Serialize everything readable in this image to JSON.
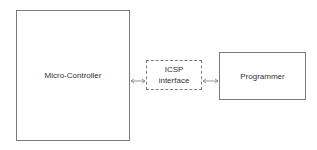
{
  "diagram": {
    "blocks": [
      {
        "id": "mcu",
        "label": "Micro-Controller",
        "style": "solid"
      },
      {
        "id": "icsp",
        "label_lines": [
          "ICSP",
          "interface"
        ],
        "style": "dashed"
      },
      {
        "id": "prog",
        "label": "Programmer",
        "style": "solid"
      }
    ],
    "connections": [
      {
        "from": "mcu",
        "to": "icsp",
        "type": "bidirectional-arrow"
      },
      {
        "from": "icsp",
        "to": "prog",
        "type": "bidirectional-arrow"
      }
    ],
    "colors": {
      "stroke": "#7a7a7a",
      "text": "#333333",
      "background": "#ffffff"
    }
  }
}
